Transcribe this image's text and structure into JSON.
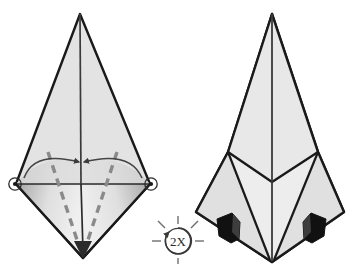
{
  "diagram": {
    "type": "origami-instruction",
    "background_color": "#ffffff",
    "paper_fill": "#e3e3e3",
    "paper_fill_light": "#eaeaea",
    "paper_fill_dark": "#cdcdcd",
    "outline_color": "#1a1a1a",
    "crease_color": "#3a3a3a",
    "dashed_fold_color": "#808080",
    "pocket_color": "#111111",
    "panel_count": 2
  },
  "left_figure": {
    "name": "before-fold",
    "description": "Tall kite-shaped model with lower diamond; dashed valley fold lines run from upper side corners down to bottom point; two curved arrows sweep inward toward the center axis and a downward arrow marks the bottom point.",
    "shape": {
      "apex": {
        "x": 80,
        "y": 14
      },
      "left_corner": {
        "x": 16,
        "y": 184
      },
      "right_corner": {
        "x": 150,
        "y": 184
      },
      "bottom_point": {
        "x": 83,
        "y": 258
      },
      "center_axis_x": 80
    },
    "markers": {
      "left_vertex_circle": true,
      "right_vertex_circle": true,
      "bottom_arrowhead": true,
      "arrow_count": 2,
      "dashed_fold_count": 2
    }
  },
  "right_figure": {
    "name": "after-fold",
    "description": "Same model after the side flaps are folded in: a V-shaped crease crosses the middle, the lower silhouette narrows to a single point, and two small black pockets appear at the left and right shoulders.",
    "shape": {
      "apex": {
        "x": 272,
        "y": 14
      },
      "left_corner": {
        "x": 196,
        "y": 212
      },
      "right_corner": {
        "x": 344,
        "y": 212
      },
      "bottom_point": {
        "x": 272,
        "y": 262
      },
      "left_shoulder": {
        "x": 228,
        "y": 152
      },
      "right_shoulder": {
        "x": 318,
        "y": 152
      },
      "v_crease_vertex": {
        "x": 272,
        "y": 182
      },
      "center_axis_x": 272
    },
    "markers": {
      "pocket_count": 2,
      "left_pocket": {
        "x": 228,
        "y": 228
      },
      "right_pocket": {
        "x": 316,
        "y": 228
      },
      "v_crease": true
    }
  },
  "repeat_badge": {
    "name": "repeat-2x",
    "label": "2X",
    "center": {
      "x": 178,
      "y": 240
    },
    "radius": 13,
    "ray_count": 6,
    "has_circular_arrow": true,
    "meaning": "Repeat this step two times"
  }
}
